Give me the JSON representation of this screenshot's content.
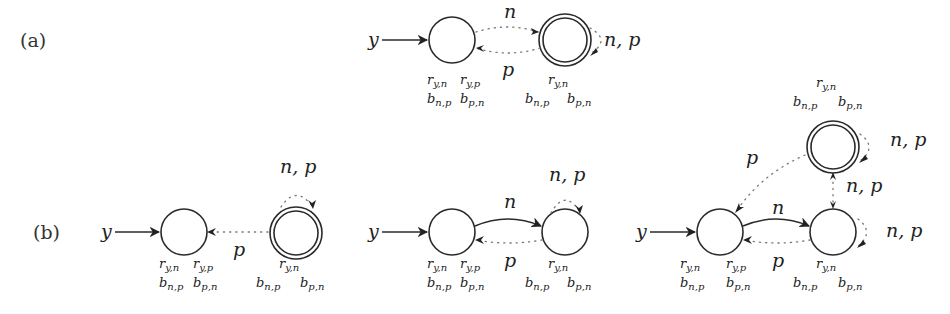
{
  "figure": {
    "parts": [
      {
        "label": "(a)",
        "input_symbol": "y",
        "states": [
          {
            "id": "a0",
            "initial": true,
            "accepting": false,
            "annot_row1": [
              "r_{y,n}",
              "r_{y,p}"
            ],
            "annot_row2": [
              "b_{n,p}",
              "b_{p,n}"
            ]
          },
          {
            "id": "a1",
            "initial": false,
            "accepting": true,
            "annot_row1": [
              "r_{y,n}"
            ],
            "annot_row2": [
              "b_{n,p}",
              "b_{p,n}"
            ]
          }
        ],
        "transitions": [
          {
            "from": "a0",
            "to": "a1",
            "label": "n",
            "style": "dotted"
          },
          {
            "from": "a1",
            "to": "a0",
            "label": "p",
            "style": "dotted"
          },
          {
            "from": "a1",
            "to": "a1",
            "label": "n, p",
            "style": "dotted"
          }
        ]
      },
      {
        "label": "(b)",
        "subfigures": [
          {
            "input_symbol": "y",
            "states": [
              {
                "id": "b10",
                "initial": true,
                "accepting": false,
                "annot_row1": [
                  "r_{y,n}",
                  "r_{y,p}"
                ],
                "annot_row2": [
                  "b_{n,p}",
                  "b_{p,n}"
                ]
              },
              {
                "id": "b11",
                "initial": false,
                "accepting": true,
                "annot_row1": [
                  "r_{y,n}"
                ],
                "annot_row2": [
                  "b_{n,p}",
                  "b_{p,n}"
                ]
              }
            ],
            "transitions": [
              {
                "from": "b11",
                "to": "b10",
                "label": "p",
                "style": "dotted"
              },
              {
                "from": "b11",
                "to": "b11",
                "label": "n, p",
                "style": "dotted"
              }
            ]
          },
          {
            "input_symbol": "y",
            "states": [
              {
                "id": "b20",
                "initial": true,
                "accepting": false,
                "annot_row1": [
                  "r_{y,n}",
                  "r_{y,p}"
                ],
                "annot_row2": [
                  "b_{n,p}",
                  "b_{p,n}"
                ]
              },
              {
                "id": "b21",
                "initial": false,
                "accepting": false,
                "annot_row1": [
                  "r_{y,n}"
                ],
                "annot_row2": [
                  "b_{n,p}",
                  "b_{p,n}"
                ]
              }
            ],
            "transitions": [
              {
                "from": "b20",
                "to": "b21",
                "label": "n",
                "style": "solid"
              },
              {
                "from": "b21",
                "to": "b20",
                "label": "p",
                "style": "dotted"
              },
              {
                "from": "b21",
                "to": "b21",
                "label": "n, p",
                "style": "dotted"
              }
            ]
          },
          {
            "input_symbol": "y",
            "states": [
              {
                "id": "b30",
                "initial": true,
                "accepting": false,
                "annot_row1": [
                  "r_{y,n}",
                  "r_{y,p}"
                ],
                "annot_row2": [
                  "b_{n,p}",
                  "b_{p,n}"
                ]
              },
              {
                "id": "b31",
                "initial": false,
                "accepting": false,
                "annot_row1": [
                  "r_{y,n}"
                ],
                "annot_row2": [
                  "b_{n,p}",
                  "b_{p,n}"
                ]
              },
              {
                "id": "b32",
                "initial": false,
                "accepting": true,
                "annot_row1": [
                  "r_{y,n}"
                ],
                "annot_row2": [
                  "b_{n,p}",
                  "b_{p,n}"
                ]
              }
            ],
            "transitions": [
              {
                "from": "b30",
                "to": "b31",
                "label": "n",
                "style": "solid"
              },
              {
                "from": "b31",
                "to": "b30",
                "label": "p",
                "style": "dotted"
              },
              {
                "from": "b31",
                "to": "b31",
                "label": "n, p",
                "style": "dotted"
              },
              {
                "from": "b32",
                "to": "b30",
                "label": "p",
                "style": "dotted"
              },
              {
                "from": "b31",
                "to": "b32",
                "label": "n, p",
                "style": "dotted",
                "bidirectional": true
              },
              {
                "from": "b32",
                "to": "b32",
                "label": "n, p",
                "style": "dotted"
              }
            ]
          }
        ]
      }
    ]
  },
  "text": {
    "part_a": "(a)",
    "part_b": "(b)",
    "y": "y",
    "n": "n",
    "p": "p",
    "np": "n, p",
    "r": "r",
    "b": "b",
    "sub_yn": "y,n",
    "sub_yp": "y,p",
    "sub_np": "n,p",
    "sub_pn": "p,n"
  }
}
